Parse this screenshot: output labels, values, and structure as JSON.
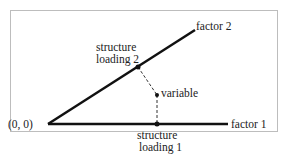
{
  "diagram": {
    "origin_label": "(0, 0)",
    "factor1_label": "factor 1",
    "factor2_label": "factor 2",
    "variable_label": "variable",
    "loading2_line1": "structure",
    "loading2_line2": "loading 2",
    "loading1_line1": "structure",
    "loading1_line2": "loading 1"
  }
}
